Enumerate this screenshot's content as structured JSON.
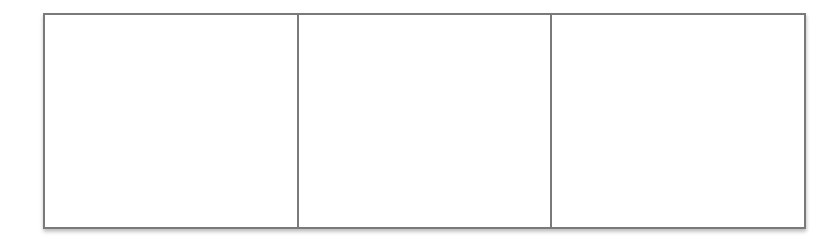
{
  "strip": {
    "panel_count": 3,
    "border_color": "#7a7a7a",
    "background": "#ffffff",
    "panels": [
      {
        "label": ""
      },
      {
        "label": ""
      },
      {
        "label": ""
      }
    ]
  }
}
